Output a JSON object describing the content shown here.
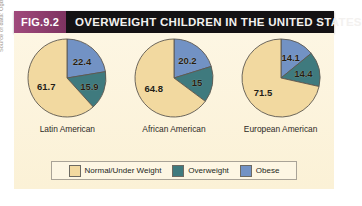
{
  "figure": {
    "tag": "FIG.9.2",
    "title": "OVERWEIGHT CHILDREN IN THE UNITED STATES",
    "source_note": "Source of data: Ogden et al., etc."
  },
  "colors": {
    "normal_under_weight": "#f2d9a0",
    "overweight": "#3f7a7e",
    "obese": "#7292c4",
    "panel_background": "#fdf4dc",
    "header_background": "#141214",
    "tag_background": "#8e3a6b",
    "slice_outline": "#5c5850"
  },
  "legend": {
    "items": [
      {
        "label": "Normal/Under Weight",
        "color": "#f2d9a0"
      },
      {
        "label": "Overweight",
        "color": "#3f7a7e"
      },
      {
        "label": "Obese",
        "color": "#7292c4"
      }
    ]
  },
  "chart_data": {
    "type": "pie",
    "title": "OVERWEIGHT CHILDREN IN THE UNITED STATES",
    "subtitle": "",
    "xlabel": "",
    "ylabel": "",
    "units": "percent",
    "legend_position": "bottom",
    "grid": false,
    "categories": [
      "Normal/Under Weight",
      "Overweight",
      "Obese"
    ],
    "series": [
      {
        "name": "Latin American",
        "values": [
          61.7,
          15.9,
          22.4
        ],
        "labels": [
          "61.7",
          "15.9",
          "22.4"
        ]
      },
      {
        "name": "African American",
        "values": [
          64.8,
          15,
          20.2
        ],
        "labels": [
          "64.8",
          "15",
          "20.2"
        ]
      },
      {
        "name": "European American",
        "values": [
          71.5,
          14.4,
          14.1
        ],
        "labels": [
          "71.5",
          "14.4",
          "14.1"
        ]
      }
    ]
  }
}
